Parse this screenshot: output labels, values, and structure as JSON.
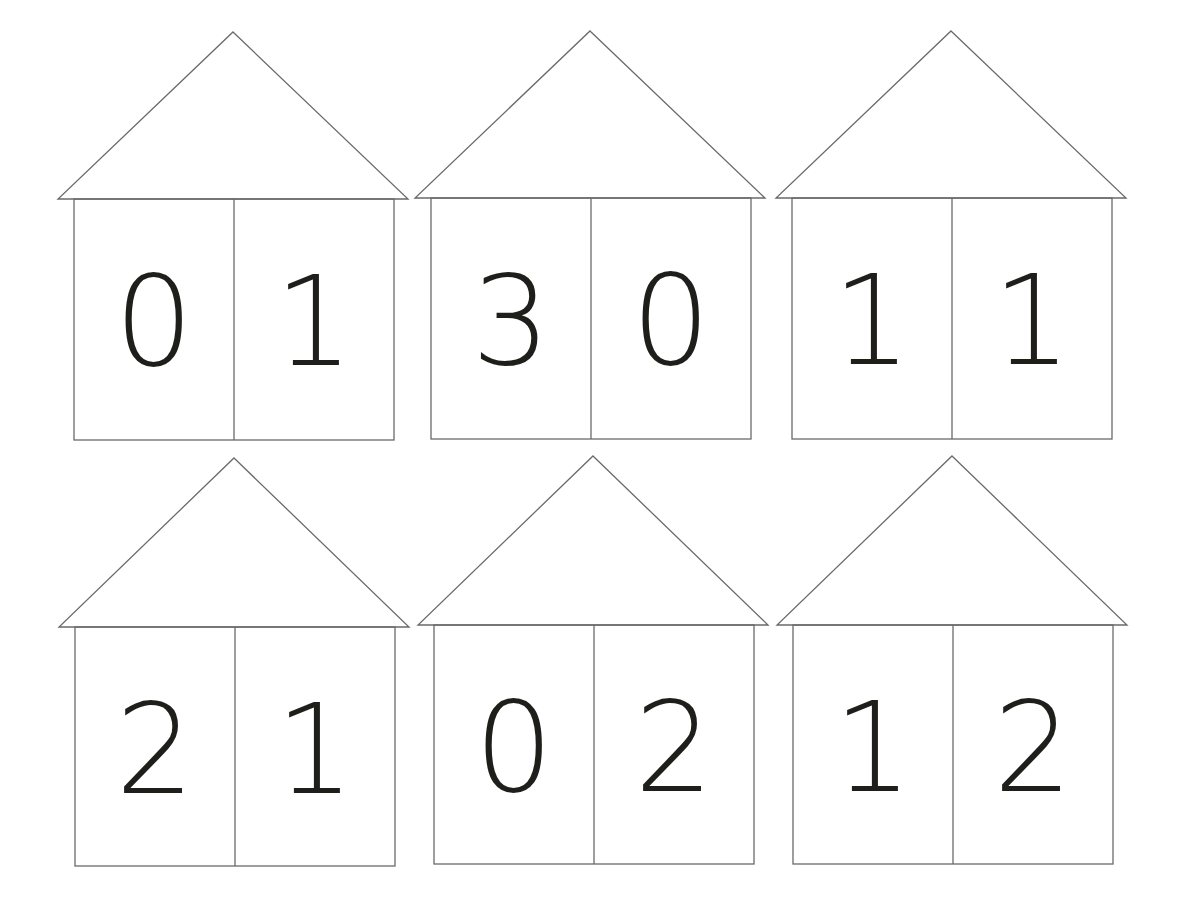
{
  "worksheet": {
    "houses": [
      {
        "left": "0",
        "right": "1"
      },
      {
        "left": "3",
        "right": "0"
      },
      {
        "left": "1",
        "right": "1"
      },
      {
        "left": "2",
        "right": "1"
      },
      {
        "left": "0",
        "right": "2"
      },
      {
        "left": "1",
        "right": "2"
      }
    ]
  },
  "colors": {
    "line": "#6a6a6a",
    "digit": "#1e1e1a",
    "background": "#ffffff"
  }
}
